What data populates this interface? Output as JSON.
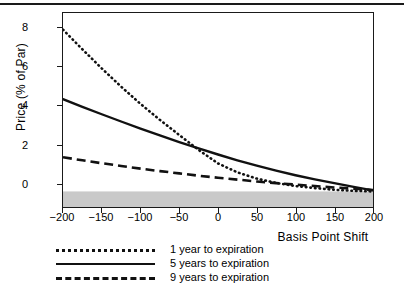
{
  "figure": {
    "top_rule": true
  },
  "chart_data": {
    "type": "line",
    "title": "",
    "xlabel": "Basis Point Shift",
    "ylabel": "Price (% of Par)",
    "xlim": [
      -200,
      200
    ],
    "ylim": [
      -0.75,
      8.6
    ],
    "xticks": [
      -200,
      -150,
      -100,
      -50,
      0,
      50,
      100,
      150,
      200
    ],
    "xticklabels": [
      "−200",
      "−150",
      "−100",
      "−50",
      "0",
      "50",
      "100",
      "150",
      "200"
    ],
    "yticks": [
      0,
      2,
      4,
      6,
      8
    ],
    "yticklabels": [
      "0",
      "2",
      "4",
      "6",
      "8"
    ],
    "grid": false,
    "legend_position": "below-left",
    "shaded_region": {
      "label": "negative-price-band",
      "y_from": -0.75,
      "y_to": 0,
      "color": "#c9c9c9"
    },
    "x": [
      -200,
      -175,
      -150,
      -125,
      -100,
      -75,
      -50,
      -25,
      0,
      25,
      50,
      75,
      100,
      125,
      150,
      175,
      200
    ],
    "series": [
      {
        "name": "1 year to expiration",
        "style": "dotted",
        "color": "#111111",
        "values": [
          7.8,
          6.85,
          5.93,
          5.05,
          4.22,
          3.45,
          2.72,
          2.0,
          1.35,
          0.92,
          0.62,
          0.41,
          0.26,
          0.16,
          0.08,
          0.03,
          0.0
        ]
      },
      {
        "name": "5 years to expiration",
        "style": "solid",
        "color": "#111111",
        "values": [
          4.45,
          4.08,
          3.72,
          3.37,
          3.03,
          2.7,
          2.38,
          2.07,
          1.78,
          1.5,
          1.24,
          1.0,
          0.78,
          0.58,
          0.4,
          0.22,
          0.05
        ]
      },
      {
        "name": "9 years to expiration",
        "style": "dashed",
        "color": "#111111",
        "values": [
          1.65,
          1.5,
          1.36,
          1.23,
          1.1,
          0.98,
          0.87,
          0.76,
          0.66,
          0.57,
          0.48,
          0.4,
          0.33,
          0.26,
          0.19,
          0.13,
          0.07
        ]
      }
    ]
  },
  "legend": {
    "items": [
      {
        "label": "1 year to expiration",
        "style": "dotted"
      },
      {
        "label": "5 years to expiration",
        "style": "solid"
      },
      {
        "label": "9 years to expiration",
        "style": "dashed"
      }
    ]
  }
}
